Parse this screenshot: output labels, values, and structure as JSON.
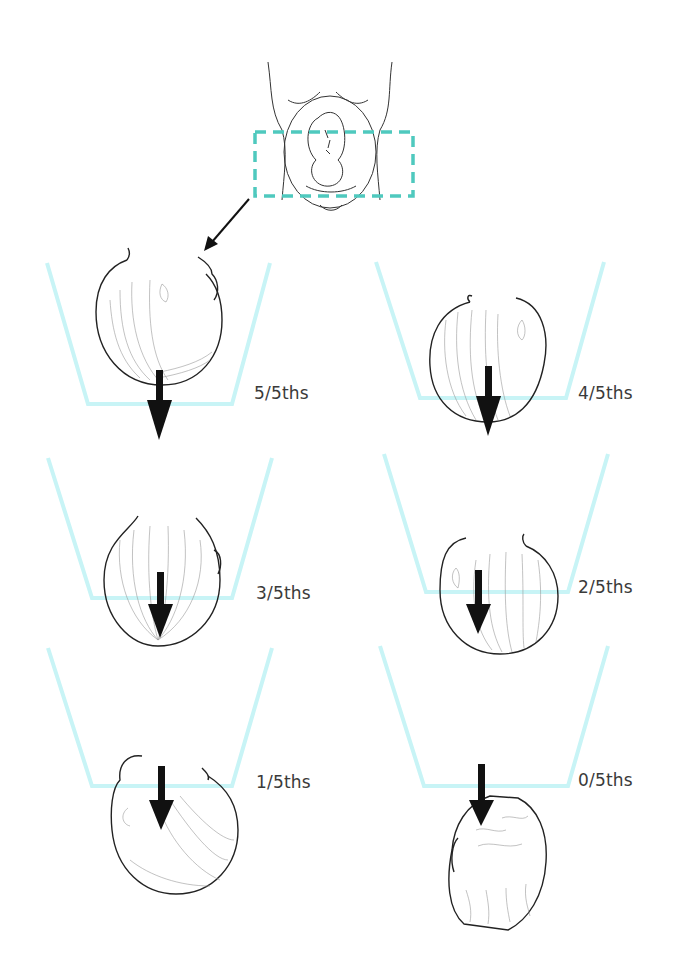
{
  "figure": {
    "colors": {
      "pelvis_outline": "#c8f4f6",
      "dashed_box": "#4fc9be",
      "arrow": "#111111",
      "line_art": "#222222",
      "label_text": "#3a3a3a"
    },
    "overview": {
      "name": "maternal-abdomen-with-fetus",
      "highlight": "dashed box over lower abdomen / pelvic brim"
    },
    "stages": [
      {
        "id": "5of5",
        "label": "5/5ths",
        "head_above_brim": 5
      },
      {
        "id": "4of5",
        "label": "4/5ths",
        "head_above_brim": 4
      },
      {
        "id": "3of5",
        "label": "3/5ths",
        "head_above_brim": 3
      },
      {
        "id": "2of5",
        "label": "2/5ths",
        "head_above_brim": 2
      },
      {
        "id": "1of5",
        "label": "1/5ths",
        "head_above_brim": 1
      },
      {
        "id": "0of5",
        "label": "0/5ths",
        "head_above_brim": 0
      }
    ]
  }
}
